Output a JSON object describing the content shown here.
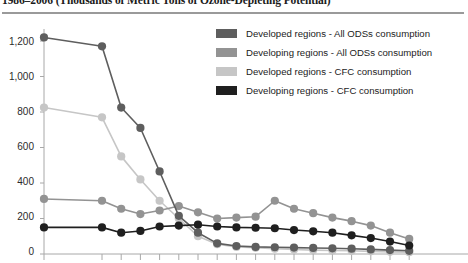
{
  "title": "1986–2006 (Thousands of Metric Tons of Ozone-Depleting Potential)",
  "legend": {
    "position": "top-right",
    "items": [
      {
        "label": "Developed regions - All ODSs consumption",
        "color": "#5e5e5e"
      },
      {
        "label": "Developing regions - All ODSs consumption",
        "color": "#939393"
      },
      {
        "label": "Developed regions - CFC consumption",
        "color": "#c6c6c6"
      },
      {
        "label": "Developing regions - CFC consumption",
        "color": "#1f1f1f"
      }
    ]
  },
  "axis": {
    "y_ticks": [
      "0",
      "200",
      "400",
      "600",
      "800",
      "1,000",
      "1,200"
    ],
    "y_min": 0,
    "y_max": 1200
  },
  "chart_data": {
    "type": "line",
    "title": "1986–2006 (Thousands of Metric Tons of Ozone-Depleting Potential)",
    "xlabel": "",
    "ylabel": "Thousands of Metric Tons of Ozone-Depleting Potential",
    "ylim": [
      0,
      1200
    ],
    "yticks": [
      0,
      200,
      400,
      600,
      800,
      1000,
      1200
    ],
    "grid": false,
    "legend_position": "top-right",
    "x": [
      1986,
      1990,
      1991,
      1992,
      1993,
      1994,
      1995,
      1996,
      1997,
      1998,
      1999,
      2000,
      2001,
      2002,
      2003,
      2004,
      2005,
      2006
    ],
    "series": [
      {
        "name": "Developed regions - All ODSs consumption",
        "color": "#5e5e5e",
        "values": [
          1220,
          1170,
          825,
          710,
          465,
          215,
          120,
          60,
          45,
          40,
          38,
          36,
          34,
          32,
          30,
          26,
          22,
          18
        ]
      },
      {
        "name": "Developing regions - All ODSs consumption",
        "color": "#939393",
        "values": [
          310,
          300,
          255,
          225,
          245,
          270,
          235,
          200,
          205,
          210,
          300,
          255,
          230,
          205,
          185,
          160,
          120,
          85
        ]
      },
      {
        "name": "Developed regions - CFC consumption",
        "color": "#c6c6c6",
        "values": [
          825,
          770,
          550,
          420,
          300,
          200,
          100,
          55,
          40,
          35,
          30,
          25,
          22,
          20,
          18,
          15,
          12,
          10
        ]
      },
      {
        "name": "Developing regions - CFC consumption",
        "color": "#1f1f1f",
        "values": [
          150,
          150,
          120,
          130,
          155,
          160,
          165,
          155,
          150,
          148,
          145,
          135,
          128,
          120,
          105,
          90,
          70,
          48
        ]
      }
    ]
  }
}
